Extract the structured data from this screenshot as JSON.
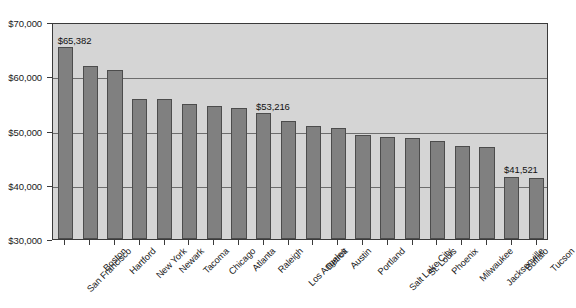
{
  "chart_data": {
    "type": "bar",
    "title": "",
    "subtitle": "",
    "xlabel": "",
    "ylabel": "",
    "ylim": [
      30000,
      70000
    ],
    "ytick_step": 10000,
    "grid": true,
    "grid_axis": "y",
    "legend": false,
    "orientation": "vertical",
    "bar_color": "#808080",
    "bar_border_color": "#4c4c4c",
    "plot_background": "#d5d5d5",
    "figure_background": "#ffffff",
    "xtick_label_rotation": -45,
    "categories": [
      "San Francisco",
      "Boston",
      "Hartford",
      "New York",
      "Newark",
      "Tacoma",
      "Chicago",
      "Atlanta",
      "Raleigh",
      "Los Angeles",
      "Detroit",
      "Austin",
      "Portland",
      "Salt Lake City",
      "St. Louis",
      "Phoenix",
      "Milwaukee",
      "Jacksonville",
      "Buffalo",
      "Tucson"
    ],
    "values": [
      65382,
      61900,
      61200,
      55900,
      55900,
      54800,
      54600,
      54100,
      53216,
      51700,
      50900,
      50400,
      49200,
      48800,
      48600,
      48000,
      47200,
      47000,
      41521,
      41200
    ],
    "ytick_labels": [
      "$70,000",
      "$60,000",
      "$50,000",
      "$40,000",
      "$30,000"
    ],
    "ytick_values": [
      70000,
      60000,
      50000,
      40000,
      30000
    ],
    "annotations": [
      {
        "category": "San Francisco",
        "text": "$65,382"
      },
      {
        "category": "Raleigh",
        "text": "$53,216"
      },
      {
        "category": "Buffalo",
        "text": "$41,521"
      }
    ]
  }
}
